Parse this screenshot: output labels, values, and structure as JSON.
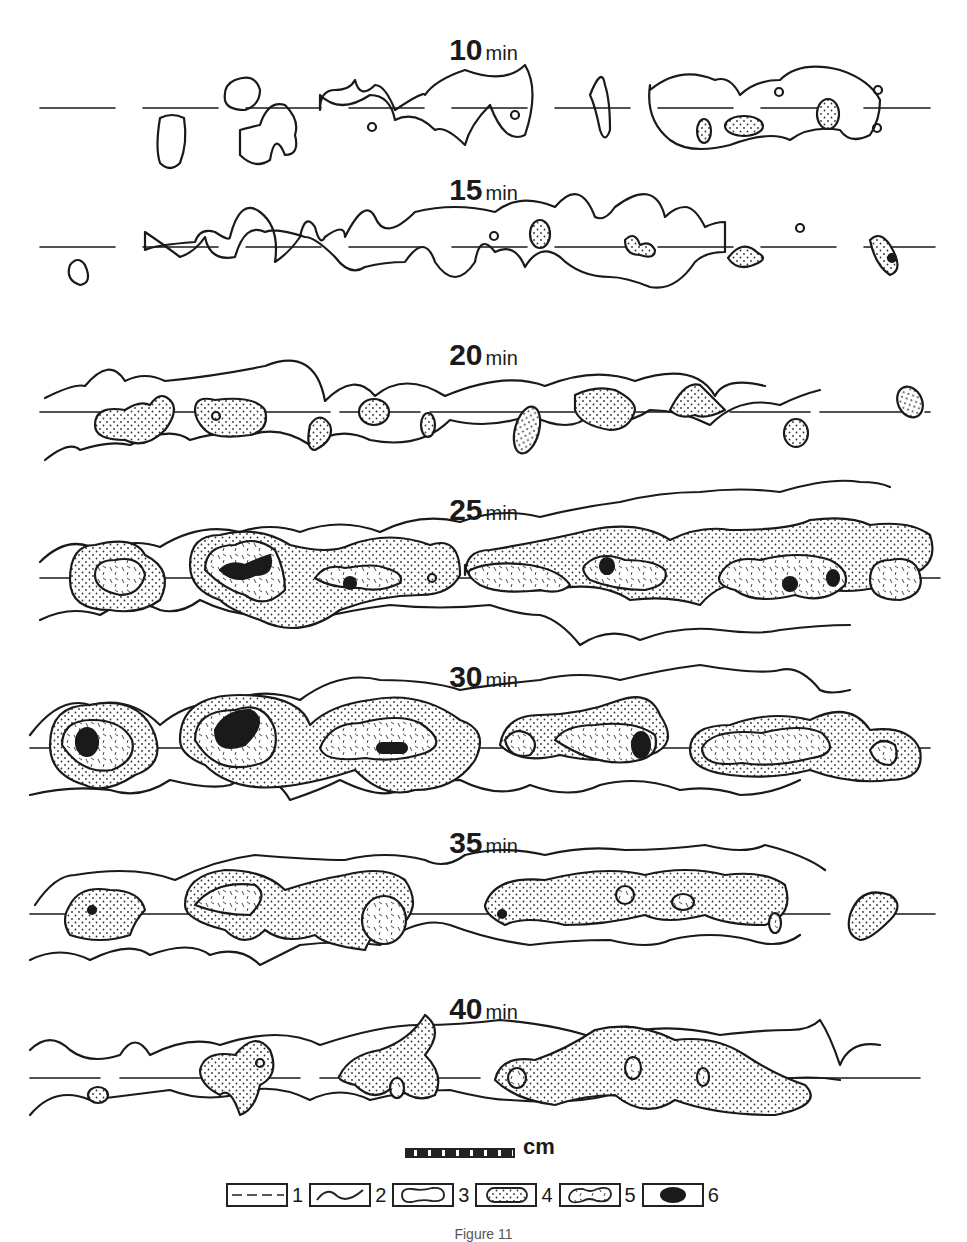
{
  "figure": {
    "panels": [
      {
        "time": "10",
        "unit": "min",
        "top": 40,
        "line_y": 108
      },
      {
        "time": "15",
        "unit": "min",
        "top": 180,
        "line_y": 247
      },
      {
        "time": "20",
        "unit": "min",
        "top": 340,
        "line_y": 412
      },
      {
        "time": "25",
        "unit": "min",
        "top": 497,
        "line_y": 578
      },
      {
        "time": "30",
        "unit": "min",
        "top": 660,
        "line_y": 748
      },
      {
        "time": "35",
        "unit": "min",
        "top": 825,
        "line_y": 914
      },
      {
        "time": "40",
        "unit": "min",
        "top": 990,
        "line_y": 1078
      }
    ],
    "scale_bar": {
      "label": "cm"
    },
    "legend": [
      {
        "number": "1",
        "symbol": "dashed-line"
      },
      {
        "number": "2",
        "symbol": "wavy-line"
      },
      {
        "number": "3",
        "symbol": "outlined-blob"
      },
      {
        "number": "4",
        "symbol": "dotted-blob"
      },
      {
        "number": "5",
        "symbol": "hatched-blob"
      },
      {
        "number": "6",
        "symbol": "solid-black-blob"
      }
    ],
    "caption": "Figure 11"
  },
  "colors": {
    "ink": "#1a1a1a",
    "paper": "#ffffff",
    "stipple": "#f2f2f2"
  }
}
